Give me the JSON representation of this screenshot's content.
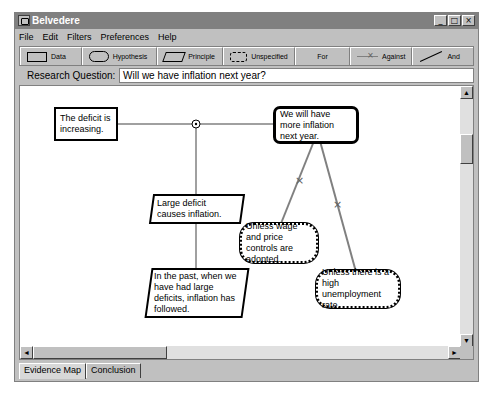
{
  "window": {
    "title": "Belvedere",
    "controls": {
      "minimize": "_",
      "maximize": "□",
      "close": "×"
    }
  },
  "menu": [
    "File",
    "Edit",
    "Filters",
    "Preferences",
    "Help"
  ],
  "toolbar": {
    "items": [
      {
        "label": "Data",
        "icon": "rectangle-icon"
      },
      {
        "label": "Hypothesis",
        "icon": "rounded-rect-icon"
      },
      {
        "label": "Principle",
        "icon": "parallelogram-icon"
      },
      {
        "label": "Unspecified",
        "icon": "cloud-icon"
      },
      {
        "label": "For",
        "icon": "line-icon"
      },
      {
        "label": "Against",
        "icon": "crossed-line-icon"
      },
      {
        "label": "And",
        "icon": "diagonal-line-icon"
      }
    ]
  },
  "research_question": {
    "label": "Research Question:",
    "value": "Will we have inflation next year?"
  },
  "canvas": {
    "nodes": [
      {
        "id": "n1",
        "type": "data",
        "text": "The deficit is increasing."
      },
      {
        "id": "n2",
        "type": "hypothesis",
        "text": "We will have more inflation next year."
      },
      {
        "id": "n3",
        "type": "principle",
        "text": "Large deficit causes inflation."
      },
      {
        "id": "n4",
        "type": "unspecified",
        "text": "Unless wage and price controls are adopted."
      },
      {
        "id": "n5",
        "type": "principle",
        "text": "In the past, when we have had large deficits, inflation has followed."
      },
      {
        "id": "n6",
        "type": "unspecified",
        "text": "Unless there is a high unemployment rate."
      }
    ],
    "links": [
      {
        "from": "n1",
        "to": "n2",
        "type": "for"
      },
      {
        "from": "n3",
        "to": "n1",
        "type": "and"
      },
      {
        "from": "n5",
        "to": "n3",
        "type": "for"
      },
      {
        "from": "n4",
        "to": "n2",
        "type": "against"
      },
      {
        "from": "n6",
        "to": "n2",
        "type": "against"
      }
    ]
  },
  "scrollbars": {
    "up": "▲",
    "down": "▼",
    "left": "◄",
    "right": "►"
  },
  "tabs": [
    {
      "label": "Evidence Map",
      "active": true
    },
    {
      "label": "Conclusion",
      "active": false
    }
  ]
}
